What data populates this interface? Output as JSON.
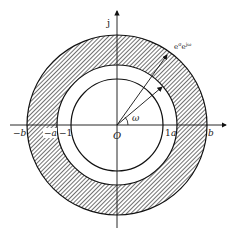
{
  "diagram": {
    "type": "complex-plane-annulus",
    "axes": {
      "vertical_label": "j",
      "origin_label": "O"
    },
    "circles": [
      {
        "name": "unit-circle",
        "radius_label": "1"
      },
      {
        "name": "inner-annulus-boundary",
        "radius_label": "a"
      },
      {
        "name": "outer-annulus-boundary",
        "radius_label": "b"
      }
    ],
    "hatched_region": "a < |z| < b",
    "tick_labels": {
      "neg_b": "−b",
      "neg_a": "−a",
      "neg_one": "−1",
      "pos_one": "1",
      "pos_a": "a",
      "pos_b": "b"
    },
    "angle_label": "ω",
    "arrow_label": "eσeʲω",
    "arrow_label_display": "e^σ e^{jω}",
    "colors": {
      "line": "#111111",
      "hatch": "#333333",
      "background": "#ffffff"
    }
  }
}
